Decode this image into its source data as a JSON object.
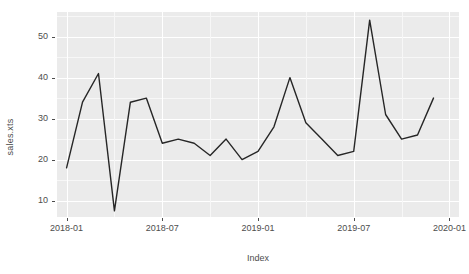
{
  "chart_data": {
    "type": "line",
    "title": "",
    "xlabel": "Index",
    "ylabel": "sales.xts",
    "grid": true,
    "legend": false,
    "x_tick_labels": [
      "2018-01",
      "2018-07",
      "2019-01",
      "2019-07",
      "2020-01"
    ],
    "x_tick_positions": [
      0,
      6,
      12,
      18,
      24
    ],
    "y_tick_labels": [
      "10",
      "20",
      "30",
      "40",
      "50"
    ],
    "y_ticks": [
      10,
      20,
      30,
      40,
      50
    ],
    "ylim": [
      6,
      56
    ],
    "xlim": [
      -0.6,
      24.6
    ],
    "series": [
      {
        "name": "sales.xts",
        "color": "#262626",
        "x": [
          "2018-01",
          "2018-02",
          "2018-03",
          "2018-04",
          "2018-05",
          "2018-06",
          "2018-07",
          "2018-08",
          "2018-09",
          "2018-10",
          "2018-11",
          "2018-12",
          "2019-01",
          "2019-02",
          "2019-03",
          "2019-04",
          "2019-05",
          "2019-06",
          "2019-07",
          "2019-08",
          "2019-09",
          "2019-10",
          "2019-11",
          "2019-12"
        ],
        "values": [
          18,
          34,
          41,
          7.5,
          34,
          35,
          24,
          25,
          24,
          21,
          25,
          20,
          22,
          28,
          40,
          29,
          25,
          21,
          22,
          54,
          31,
          25,
          26,
          35
        ]
      }
    ]
  },
  "axes": {
    "y_title": "sales.xts",
    "x_title": "Index"
  },
  "style": {
    "panel_background": "#ebebeb",
    "gridline_major": "#ffffff",
    "gridline_minor": "#f7f7f7",
    "line_color": "#262626",
    "text_color": "#4d4d4d"
  }
}
